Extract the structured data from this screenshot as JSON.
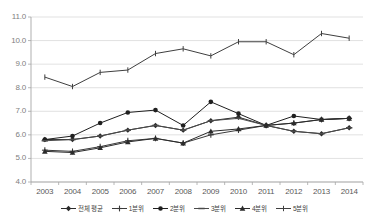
{
  "chart_data": {
    "type": "line",
    "title": "",
    "subtitle": "",
    "xlabel": "",
    "ylabel": "",
    "categories": [
      "2003",
      "2004",
      "2005",
      "2006",
      "2007",
      "2008",
      "2009",
      "2010",
      "2011",
      "2012",
      "2013",
      "2014"
    ],
    "ylim": [
      4.0,
      11.0
    ],
    "ytick_labels": [
      "11.0",
      "10.0",
      "9.0",
      "8.0",
      "7.0",
      "6.0",
      "5.0",
      "4.0"
    ],
    "ytick_values": [
      11.0,
      10.0,
      9.0,
      8.0,
      7.0,
      6.0,
      5.0,
      4.0
    ],
    "grid": true,
    "legend_position": "bottom",
    "series": [
      {
        "name": "전체 평균",
        "marker": "diamond",
        "color": "#2b2b2b",
        "values": [
          5.8,
          5.8,
          5.95,
          6.2,
          6.4,
          6.2,
          6.6,
          6.75,
          6.4,
          6.15,
          6.05,
          6.3
        ]
      },
      {
        "name": "1분위",
        "marker": "plus",
        "color": "#3a3a3a",
        "values": [
          5.35,
          5.3,
          5.5,
          5.75,
          5.85,
          5.65,
          6.0,
          6.2,
          6.4,
          6.5,
          6.65,
          6.7
        ]
      },
      {
        "name": "2분위",
        "marker": "circle",
        "color": "#1f1f1f",
        "values": [
          5.8,
          5.95,
          6.5,
          6.95,
          7.05,
          6.4,
          7.4,
          6.9,
          6.4,
          6.8,
          6.65,
          6.7
        ]
      },
      {
        "name": "3분위",
        "marker": "dash",
        "color": "#4a4a4a",
        "values": [
          5.75,
          5.8,
          5.95,
          6.2,
          6.4,
          6.2,
          6.6,
          6.7,
          6.4,
          6.15,
          6.05,
          6.3
        ]
      },
      {
        "name": "4분위",
        "marker": "triangle",
        "color": "#2b2b2b",
        "values": [
          5.3,
          5.25,
          5.45,
          5.7,
          5.85,
          5.65,
          6.15,
          6.25,
          6.4,
          6.5,
          6.65,
          6.7
        ]
      },
      {
        "name": "5분위",
        "marker": "line-plus",
        "color": "#3f3f3f",
        "values": [
          8.45,
          8.05,
          8.65,
          8.75,
          9.45,
          9.65,
          9.35,
          9.95,
          9.95,
          9.4,
          10.3,
          10.1
        ]
      }
    ]
  },
  "legend": {
    "items": [
      {
        "label": "전체 평균"
      },
      {
        "label": "1분위"
      },
      {
        "label": "2분위"
      },
      {
        "label": "3분위"
      },
      {
        "label": "4분위"
      },
      {
        "label": "5분위"
      }
    ]
  }
}
